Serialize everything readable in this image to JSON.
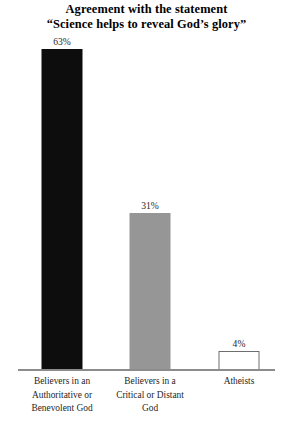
{
  "chart_data": {
    "type": "bar",
    "title": "Agreement with the statement “Science helps to reveal God’s glory”",
    "title_lines": [
      "Agreement with the statement",
      "“Science helps to reveal God’s glory”"
    ],
    "xlabel": "",
    "ylabel": "",
    "ylim": [
      0,
      100
    ],
    "grid": false,
    "legend": "none",
    "categories": [
      "Believers in an Authoritative or Benevolent God",
      "Believers in a Critical or Distant God",
      "Atheists"
    ],
    "category_lines": [
      [
        "Believers in an",
        "Authoritative or",
        "Benevolent God"
      ],
      [
        "Believers in a",
        "Critical or Distant",
        "God"
      ],
      [
        "Atheists"
      ]
    ],
    "values": [
      63,
      31,
      4
    ],
    "value_labels": [
      "63%",
      "31%",
      "4%"
    ],
    "bar_colors": [
      "#0d0d0d",
      "#969696",
      "#ffffff"
    ],
    "bar_border_colors": [
      "#0d0d0d",
      "#969696",
      "#6e6e6e"
    ],
    "axis_color": "#8c8c8c"
  }
}
